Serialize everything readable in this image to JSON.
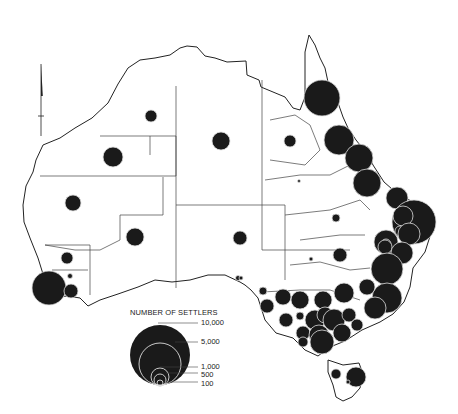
{
  "map": {
    "title": "Number of settlers by region, Australia",
    "symbol_color": "#1a1a1a",
    "outline_color": "#222222"
  },
  "legend": {
    "title": "NUMBER OF SETTLERS",
    "entries": [
      {
        "label": "10,000",
        "value": 10000
      },
      {
        "label": "5,000",
        "value": 5000
      },
      {
        "label": "1,000",
        "value": 1000
      },
      {
        "label": "500",
        "value": 500
      },
      {
        "label": "100",
        "value": 100
      }
    ]
  },
  "north_arrow": {
    "icon": "north-arrow-icon"
  },
  "symbols": [
    {
      "cx": 151,
      "cy": 116,
      "r": 6
    },
    {
      "cx": 113,
      "cy": 157,
      "r": 10
    },
    {
      "cx": 73,
      "cy": 203,
      "r": 8
    },
    {
      "cx": 135,
      "cy": 237,
      "r": 9
    },
    {
      "cx": 67,
      "cy": 258,
      "r": 6
    },
    {
      "cx": 70,
      "cy": 276,
      "r": 2.5
    },
    {
      "cx": 49,
      "cy": 288,
      "r": 17
    },
    {
      "cx": 71,
      "cy": 291,
      "r": 7
    },
    {
      "cx": 221,
      "cy": 141,
      "r": 9
    },
    {
      "cx": 240,
      "cy": 238,
      "r": 7
    },
    {
      "cx": 238,
      "cy": 278,
      "r": 2.5
    },
    {
      "cx": 290,
      "cy": 141,
      "r": 6
    },
    {
      "cx": 299,
      "cy": 181,
      "r": 1.5
    },
    {
      "cx": 322,
      "cy": 98,
      "r": 18
    },
    {
      "cx": 339,
      "cy": 140,
      "r": 15
    },
    {
      "cx": 359,
      "cy": 158,
      "r": 14
    },
    {
      "cx": 367,
      "cy": 183,
      "r": 14
    },
    {
      "cx": 336,
      "cy": 218,
      "r": 4
    },
    {
      "cx": 397,
      "cy": 198,
      "r": 11
    },
    {
      "cx": 414,
      "cy": 222,
      "r": 22
    },
    {
      "cx": 403,
      "cy": 216,
      "r": 10
    },
    {
      "cx": 386,
      "cy": 242,
      "r": 12
    },
    {
      "cx": 400,
      "cy": 231,
      "r": 5
    },
    {
      "cx": 409,
      "cy": 234,
      "r": 11
    },
    {
      "cx": 386,
      "cy": 244,
      "r": 5
    },
    {
      "cx": 385,
      "cy": 247,
      "r": 7
    },
    {
      "cx": 402,
      "cy": 253,
      "r": 11
    },
    {
      "cx": 387,
      "cy": 269,
      "r": 16
    },
    {
      "cx": 311,
      "cy": 259,
      "r": 2
    },
    {
      "cx": 340,
      "cy": 255,
      "r": 7
    },
    {
      "cx": 387,
      "cy": 298,
      "r": 15
    },
    {
      "cx": 367,
      "cy": 287,
      "r": 8
    },
    {
      "cx": 375,
      "cy": 308,
      "r": 11
    },
    {
      "cx": 241,
      "cy": 278,
      "r": 2
    },
    {
      "cx": 263,
      "cy": 291,
      "r": 4
    },
    {
      "cx": 267,
      "cy": 306,
      "r": 7
    },
    {
      "cx": 283,
      "cy": 297,
      "r": 8
    },
    {
      "cx": 300,
      "cy": 300,
      "r": 9
    },
    {
      "cx": 323,
      "cy": 300,
      "r": 9
    },
    {
      "cx": 344,
      "cy": 293,
      "r": 10
    },
    {
      "cx": 286,
      "cy": 320,
      "r": 7
    },
    {
      "cx": 300,
      "cy": 316,
      "r": 4
    },
    {
      "cx": 315,
      "cy": 320,
      "r": 10
    },
    {
      "cx": 325,
      "cy": 315,
      "r": 8
    },
    {
      "cx": 334,
      "cy": 320,
      "r": 11
    },
    {
      "cx": 349,
      "cy": 315,
      "r": 7
    },
    {
      "cx": 357,
      "cy": 325,
      "r": 6
    },
    {
      "cx": 303,
      "cy": 333,
      "r": 7
    },
    {
      "cx": 319,
      "cy": 335,
      "r": 10
    },
    {
      "cx": 342,
      "cy": 333,
      "r": 9
    },
    {
      "cx": 322,
      "cy": 342,
      "r": 12
    },
    {
      "cx": 303,
      "cy": 342,
      "r": 5
    },
    {
      "cx": 356,
      "cy": 377,
      "r": 10
    },
    {
      "cx": 336,
      "cy": 374,
      "r": 5
    },
    {
      "cx": 348,
      "cy": 382,
      "r": 2
    }
  ]
}
